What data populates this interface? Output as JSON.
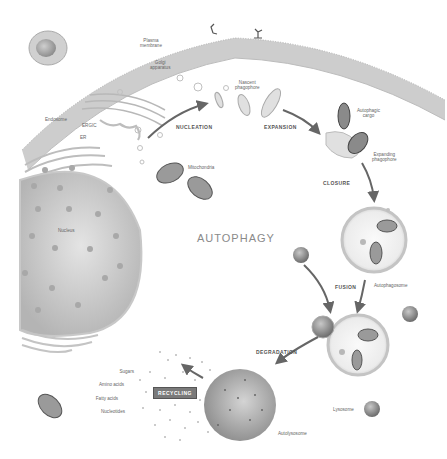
{
  "diagram": {
    "title": "AUTOPHAGY",
    "stages": {
      "nucleation": "NUCLEATION",
      "expansion": "EXPANSION",
      "closure": "CLOSURE",
      "fusion": "FUSION",
      "degradation": "DEGRADATION",
      "recycling": "RECYCLING"
    },
    "labels": {
      "plasma_membrane": "Plasma\nmembrane",
      "golgi": "Golgi\napparatus",
      "endosome": "Endosome",
      "ergic": "ERGIC",
      "er": "ER",
      "nascent_phagophore": "Nascent\nphagophore",
      "autophagic_cargo": "Autophagic\ncargo",
      "expanding_phagophore": "Expanding\nphagophore",
      "mitochondria": "Mitochondria",
      "nucleus": "Nucleus",
      "autophagosome": "Autophagosome",
      "lysosome": "Lysosome",
      "autolysosome": "Autolysosome"
    },
    "recycled_products": [
      "Sugars",
      "Amino acids",
      "Fatty acids",
      "Nucleotides"
    ]
  }
}
